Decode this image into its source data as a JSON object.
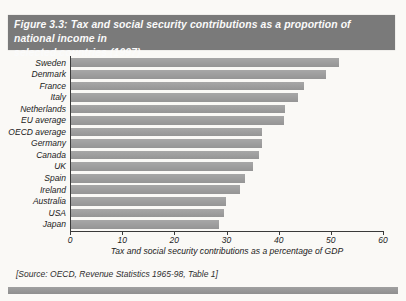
{
  "figure": {
    "title_line1": "Figure 3.3: Tax and social security contributions as a proportion of national income in",
    "title_line2": "selected countries (1997)",
    "source_note": "[Source: OECD, Revenue Statistics 1965-98, Table 1]"
  },
  "chart_data": {
    "type": "bar",
    "orientation": "horizontal",
    "title": "Figure 3.3: Tax and social security contributions as a proportion of national income in selected countries (1997)",
    "categories": [
      "Sweden",
      "Denmark",
      "France",
      "Italy",
      "Netherlands",
      "EU average",
      "OECD average",
      "Germany",
      "Canada",
      "UK",
      "Spain",
      "Ireland",
      "Australia",
      "USA",
      "Japan"
    ],
    "values": [
      51.5,
      49.0,
      44.8,
      43.7,
      41.3,
      41.0,
      36.7,
      36.7,
      36.3,
      35.0,
      33.5,
      32.6,
      29.8,
      29.5,
      28.6
    ],
    "xlabel": "Tax and social security contributions as a percentage of GDP",
    "xlim": [
      0,
      60
    ],
    "x_ticks": [
      0,
      10,
      20,
      30,
      40,
      50,
      60
    ],
    "grid": "off",
    "legend": "none",
    "bar_color": "#9d9d9d",
    "title_bar_color": "#7a7a7a"
  }
}
